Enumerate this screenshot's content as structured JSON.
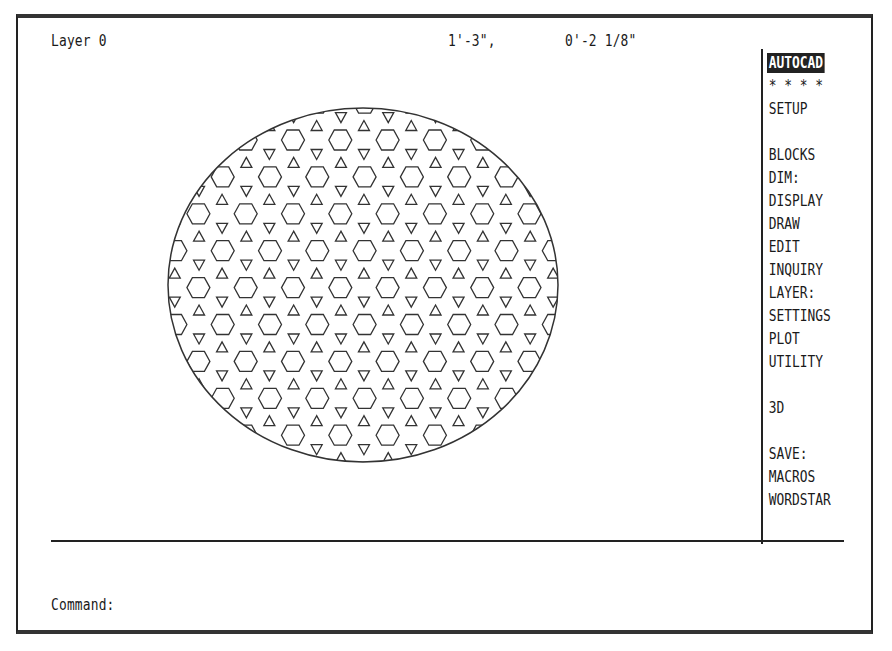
{
  "status": {
    "layer": "Layer 0",
    "coord_x": "1'-3\",",
    "coord_y": "0'-2 1/8\""
  },
  "side_menu": {
    "items": [
      {
        "label": "AUTOCAD",
        "row": 0,
        "active": true
      },
      {
        "label": "* * * *",
        "row": 1
      },
      {
        "label": "SETUP",
        "row": 2
      },
      {
        "label": "BLOCKS",
        "row": 4
      },
      {
        "label": "DIM:",
        "row": 5
      },
      {
        "label": "DISPLAY",
        "row": 6
      },
      {
        "label": "DRAW",
        "row": 7
      },
      {
        "label": "EDIT",
        "row": 8
      },
      {
        "label": "INQUIRY",
        "row": 9
      },
      {
        "label": "LAYER:",
        "row": 10
      },
      {
        "label": "SETTINGS",
        "row": 11
      },
      {
        "label": "PLOT",
        "row": 12
      },
      {
        "label": "UTILITY",
        "row": 13
      },
      {
        "label": "3D",
        "row": 15
      },
      {
        "label": "SAVE:",
        "row": 17
      },
      {
        "label": "MACROS",
        "row": 18
      },
      {
        "label": "WORDSTAR",
        "row": 19
      }
    ]
  },
  "command": {
    "prompt": "Command:"
  },
  "drawing": {
    "entity": "ellipse with hatch pattern",
    "ellipse": {
      "cx": 363,
      "cy": 285,
      "rx": 195,
      "ry": 177
    },
    "hatch": {
      "pattern": "hexagons with up/down triangles",
      "col_spacing": 47.3,
      "row_spacing": 36.9,
      "first_row_y": 140,
      "row_a_x0": 270,
      "row_b_x0": 293
    },
    "stroke_color": "#333333"
  }
}
